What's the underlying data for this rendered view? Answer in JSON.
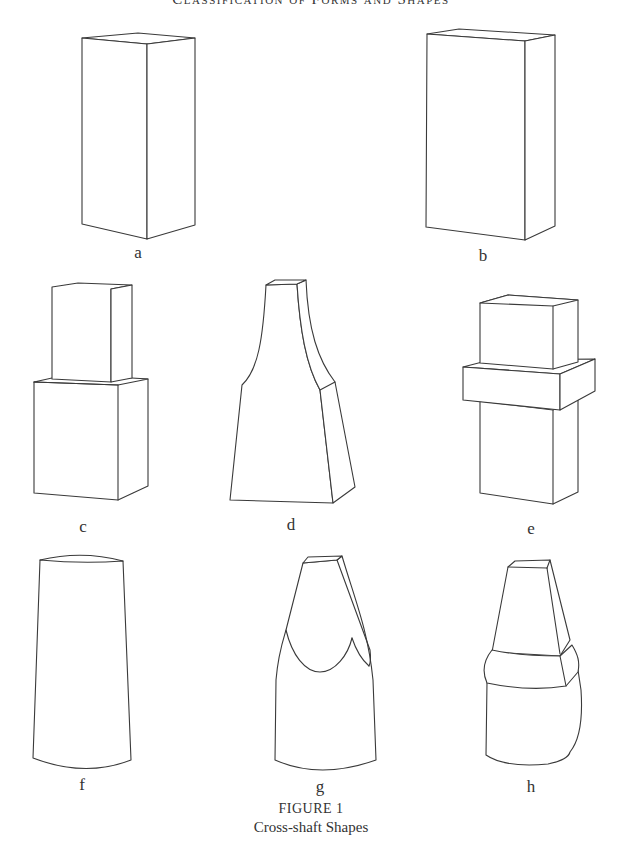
{
  "page": {
    "running_head": "Classification of Forms and Shapes"
  },
  "figure": {
    "number_label": "FIGURE 1",
    "title": "Cross-shaft Shapes",
    "shapes": [
      {
        "id": "a",
        "label": "a",
        "description": "tall rectangular shaft"
      },
      {
        "id": "b",
        "label": "b",
        "description": "broad rectangular shaft"
      },
      {
        "id": "c",
        "label": "c",
        "description": "stepped shaft with narrower upper block"
      },
      {
        "id": "d",
        "label": "d",
        "description": "tapering shaft with concave necked top"
      },
      {
        "id": "e",
        "label": "e",
        "description": "shaft with projecting collar band"
      },
      {
        "id": "f",
        "label": "f",
        "description": "round tapering shaft"
      },
      {
        "id": "g",
        "label": "g",
        "description": "round-shaft with scooped transition to square top"
      },
      {
        "id": "h",
        "label": "h",
        "description": "round-shaft with collar and tapering square top"
      }
    ]
  }
}
